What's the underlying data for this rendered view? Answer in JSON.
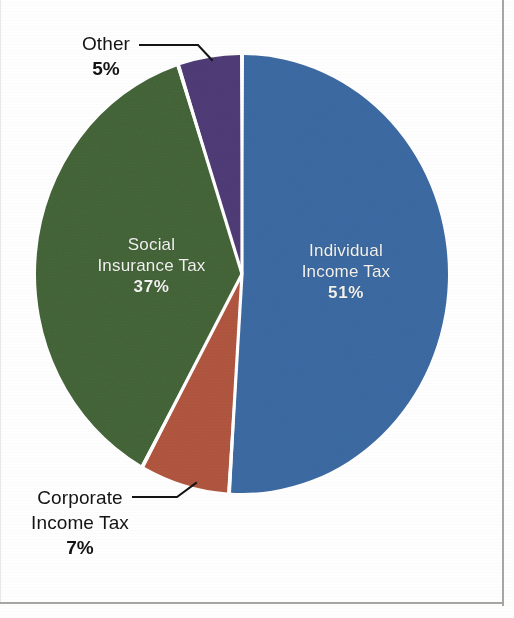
{
  "chart_data": {
    "type": "pie",
    "title": "",
    "legend_position": "none",
    "labels_inside": true,
    "slices": [
      {
        "name": "Individual Income Tax",
        "label_line1": "Individual",
        "label_line2": "Income Tax",
        "value": 51,
        "percent_text": "51%",
        "color": "#3d6ba4",
        "label_placement": "inside",
        "label_color": "#f2f3f0"
      },
      {
        "name": "Corporate Income Tax",
        "label_line1": "Corporate",
        "label_line2": "Income Tax",
        "value": 7,
        "percent_text": "7%",
        "color": "#b25740",
        "label_placement": "callout",
        "label_color": "#141414"
      },
      {
        "name": "Social Insurance Tax",
        "label_line1": "Social",
        "label_line2": "Insurance Tax",
        "value": 37,
        "percent_text": "37%",
        "color": "#45663a",
        "label_placement": "inside",
        "label_color": "#f2f3f0"
      },
      {
        "name": "Other",
        "label_line1": "Other",
        "label_line2": "",
        "value": 5,
        "percent_text": "5%",
        "color": "#503c77",
        "label_placement": "callout",
        "label_color": "#141414"
      }
    ],
    "total": 100,
    "units": "percent",
    "start_angle_deg": 0,
    "direction": "clockwise",
    "background": "#fefefe",
    "separator_color": "#ffffff"
  },
  "page": {
    "background_color": "#fefefe",
    "frame_color": "#a8a6a3"
  }
}
